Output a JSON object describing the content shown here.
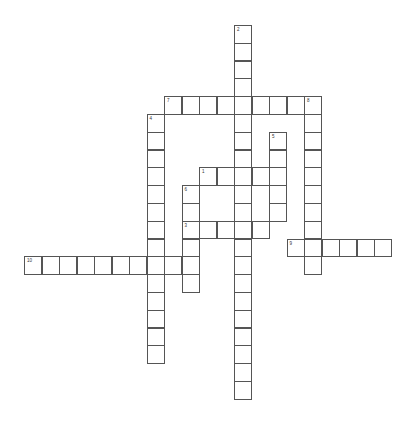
{
  "puzzle": {
    "type": "crossword",
    "grid": {
      "origin_x": 24,
      "origin_y": 25,
      "cell_w": 17.5,
      "cell_h": 17.8,
      "border_color": "#555555",
      "cell_color": "#ffffff"
    },
    "words": [
      {
        "number": "1",
        "direction": "across",
        "row": 8,
        "col": 10,
        "length": 5
      },
      {
        "number": "2",
        "direction": "down",
        "row": 0,
        "col": 12,
        "length": 21
      },
      {
        "number": "3",
        "direction": "across",
        "row": 11,
        "col": 9,
        "length": 5
      },
      {
        "number": "4",
        "direction": "down",
        "row": 5,
        "col": 7,
        "length": 14
      },
      {
        "number": "5",
        "direction": "down",
        "row": 6,
        "col": 14,
        "length": 5
      },
      {
        "number": "6",
        "direction": "down",
        "row": 9,
        "col": 9,
        "length": 6
      },
      {
        "number": "7",
        "direction": "across",
        "row": 4,
        "col": 8,
        "length": 9
      },
      {
        "number": "8",
        "direction": "down",
        "row": 4,
        "col": 16,
        "length": 10
      },
      {
        "number": "9",
        "direction": "across",
        "row": 12,
        "col": 15,
        "length": 6
      },
      {
        "number": "10",
        "direction": "across",
        "row": 13,
        "col": 0,
        "length": 10
      }
    ]
  }
}
